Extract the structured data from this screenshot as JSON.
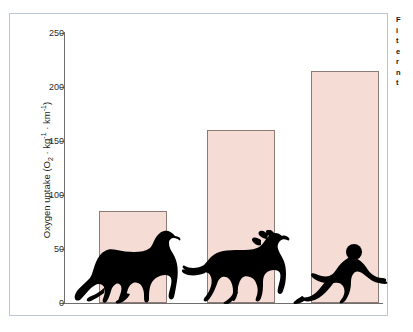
{
  "chart_data": {
    "type": "bar",
    "title": "",
    "subtitle": "",
    "xlabel": "",
    "ylabel": "Oxygen uptake (O2 · kg-1 · km-1)",
    "ylabel_parts": {
      "prefix": "Oxygen uptake (O",
      "sub_2": "2",
      "mid": " · kg",
      "sup_1": "-1",
      "mid2": " · km",
      "sup_2": "-1",
      "suffix": ")"
    },
    "categories": [
      "camel",
      "horse",
      "human"
    ],
    "values": [
      85,
      160,
      215
    ],
    "ylim": [
      0,
      250
    ],
    "yticks": [
      0,
      50,
      100,
      150,
      200,
      250
    ],
    "ytick_labels": [
      "0",
      "50",
      "100",
      "150",
      "200",
      "250"
    ],
    "grid": false,
    "legend": "none",
    "bar_fill_color": "#f5ddd6",
    "bar_border_color": "#8d7a74",
    "axis_color": "#6f6f6f",
    "silhouettes": [
      "camel",
      "horse",
      "human-sprinter"
    ],
    "annotations": []
  },
  "figure": {
    "panel_border_color": "#b9c6d4",
    "background_color": "#ffffff"
  },
  "caption": {
    "lines": [
      "F",
      "i",
      "t",
      "e",
      "r",
      "n",
      "t"
    ]
  }
}
